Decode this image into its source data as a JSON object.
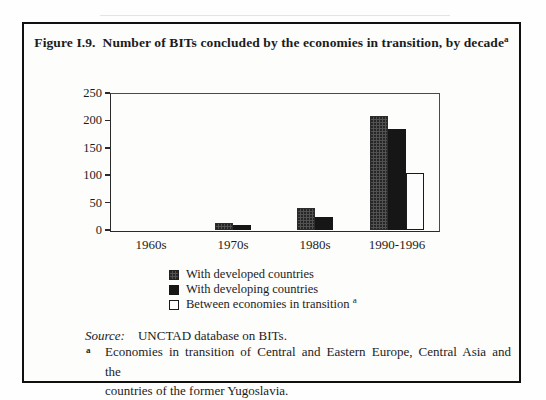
{
  "figure": {
    "label": "Figure I.9.",
    "title": "Number of BITs concluded by the economies in transition, by decade",
    "footnote_mark": "a"
  },
  "chart_data": {
    "type": "bar",
    "title": "Number of BITs concluded by the economies in transition, by decade",
    "categories": [
      "1960s",
      "1970s",
      "1980s",
      "1990-1996"
    ],
    "series": [
      {
        "name": "With developed countries",
        "color": "#525252",
        "values": [
          0,
          13,
          40,
          208
        ]
      },
      {
        "name": "With developing countries",
        "color": "#161616",
        "values": [
          0,
          10,
          23,
          185
        ]
      },
      {
        "name": "Between economies in transition",
        "color": "#fdfdfd",
        "values": [
          0,
          0,
          0,
          105
        ]
      }
    ],
    "xlabel": "",
    "ylabel": "",
    "ylim": [
      0,
      250
    ],
    "yticks": [
      0,
      50,
      100,
      150,
      200,
      250
    ],
    "grid": false,
    "legend_position": "bottom-left-inside-figure",
    "legend_footnote_mark": "a"
  },
  "source": {
    "label": "Source:",
    "text": "UNCTAD database on BITs."
  },
  "footnote": {
    "mark": "a",
    "lines": [
      "Economies in transition of Central and Eastern Europe, Central Asia and the",
      "countries of the former Yugoslavia."
    ]
  }
}
